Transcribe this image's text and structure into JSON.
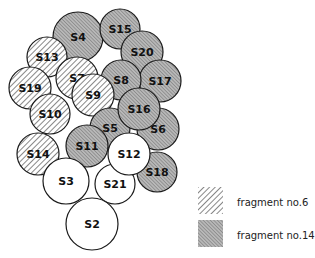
{
  "colors": {
    "stroke": "#1a1a1a",
    "hatch": "#555555",
    "shade": "#a8a8a8",
    "plain": "#ffffff"
  },
  "circles": [
    {
      "id": "S4",
      "cx": 78,
      "cy": 37,
      "r": 25,
      "fill": "shade"
    },
    {
      "id": "S15",
      "cx": 120,
      "cy": 29,
      "r": 20,
      "fill": "shade"
    },
    {
      "id": "S20",
      "cx": 142,
      "cy": 52,
      "r": 21,
      "fill": "shade"
    },
    {
      "id": "S13",
      "cx": 47,
      "cy": 57,
      "r": 20,
      "fill": "hatch"
    },
    {
      "id": "S17",
      "cx": 160,
      "cy": 81,
      "r": 21,
      "fill": "shade"
    },
    {
      "id": "S8",
      "cx": 121,
      "cy": 80,
      "r": 20,
      "fill": "shade"
    },
    {
      "id": "S7",
      "cx": 77,
      "cy": 78,
      "r": 21,
      "fill": "hatch"
    },
    {
      "id": "S19",
      "cx": 30,
      "cy": 88,
      "r": 21,
      "fill": "hatch"
    },
    {
      "id": "S10",
      "cx": 50,
      "cy": 114,
      "r": 20,
      "fill": "hatch"
    },
    {
      "id": "S9",
      "cx": 93,
      "cy": 95,
      "r": 21,
      "fill": "hatch"
    },
    {
      "id": "S5",
      "cx": 110,
      "cy": 128,
      "r": 20,
      "fill": "shade"
    },
    {
      "id": "S6",
      "cx": 158,
      "cy": 129,
      "r": 21,
      "fill": "shade"
    },
    {
      "id": "S16",
      "cx": 139,
      "cy": 109,
      "r": 21,
      "fill": "shade"
    },
    {
      "id": "S18",
      "cx": 157,
      "cy": 172,
      "r": 20,
      "fill": "shade"
    },
    {
      "id": "S14",
      "cx": 38,
      "cy": 154,
      "r": 21,
      "fill": "hatch"
    },
    {
      "id": "S11",
      "cx": 87,
      "cy": 146,
      "r": 21,
      "fill": "shade"
    },
    {
      "id": "S3",
      "cx": 66,
      "cy": 181,
      "r": 23,
      "fill": "plain"
    },
    {
      "id": "S21",
      "cx": 115,
      "cy": 184,
      "r": 20,
      "fill": "plain"
    },
    {
      "id": "S12",
      "cx": 129,
      "cy": 154,
      "r": 21,
      "fill": "plain"
    },
    {
      "id": "S2",
      "cx": 92,
      "cy": 224,
      "r": 26,
      "fill": "plain"
    }
  ],
  "legend": [
    {
      "pattern": "hatch",
      "label": "fragment no.6"
    },
    {
      "pattern": "shade",
      "label": "fragment no.14"
    }
  ]
}
